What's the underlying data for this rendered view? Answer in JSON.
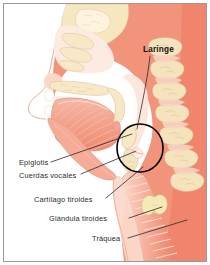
{
  "figure": {
    "subject": "Laringe",
    "view": "sagittal-section-head-neck",
    "title_label": "Laringe"
  },
  "labels": {
    "laringe": "Laringe",
    "epiglotis": "Epiglotis",
    "cuerdas_vocales": "Cuerdas vocales",
    "cartilago_tiroides": "Cartílago tiroides",
    "glandula_tiroides": "Glándula tiroides",
    "traquea": "Tráquea"
  },
  "colors": {
    "page_background": "#ffffff",
    "frame_border": "#9a9a9a",
    "tissue_mid": "#f4a08c",
    "tissue_deep": "#ef7a63",
    "tissue_light": "#fbcdbe",
    "tissue_pale": "#fde3d8",
    "cartilage_cream": "#f6e7c0",
    "bone_cream": "#f3e2bb",
    "outline": "#d98f78",
    "leader_line": "#2b2b2b",
    "highlight_circle": "#000000",
    "label_text": "#2c2c2c"
  },
  "annotations": {
    "highlight_circle": {
      "shape": "ellipse",
      "center_x": 136,
      "center_y": 144,
      "radius_x": 23,
      "radius_y": 24,
      "stroke_width": 1.6
    },
    "leaders": [
      {
        "name": "laringe-leader",
        "from": [
          146,
          52
        ],
        "to": [
          133,
          125
        ]
      },
      {
        "name": "epiglotis-leader",
        "from": [
          47,
          158
        ],
        "to": [
          128,
          130
        ]
      },
      {
        "name": "cuerdas-vocales-leader",
        "from": [
          77,
          170
        ],
        "to": [
          132,
          146
        ]
      },
      {
        "name": "cartilago-tiroides-leader",
        "from": [
          102,
          194
        ],
        "to": [
          139,
          163
        ]
      },
      {
        "name": "glandula-tiroides-leader",
        "from": [
          125,
          214
        ],
        "to": [
          158,
          203
        ]
      },
      {
        "name": "traquea-leader",
        "from": [
          124,
          234
        ],
        "to": [
          183,
          216
        ]
      }
    ]
  }
}
